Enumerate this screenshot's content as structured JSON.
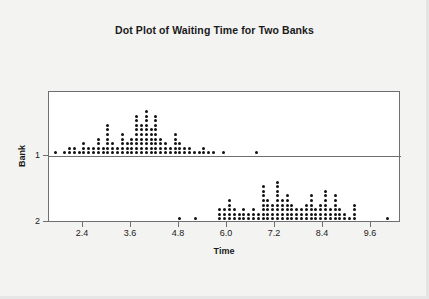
{
  "chart_data": {
    "type": "scatter",
    "plot_style": "dotplot",
    "title": "Dot Plot of Waiting Time for Two Banks",
    "xlabel": "Time",
    "ylabel": "Bank",
    "grid": false,
    "legend": "none",
    "xlim": [
      1.55,
      10.35
    ],
    "x_ticks": [
      2.4,
      3.6,
      4.8,
      6.0,
      7.2,
      8.4,
      9.6
    ],
    "x_tick_labels": [
      "2.4",
      "3.6",
      "4.8",
      "6.0",
      "7.2",
      "8.4",
      "9.6"
    ],
    "y_ticks": [
      1,
      2
    ],
    "y_tick_labels": [
      "1",
      "2"
    ],
    "bin_width": 0.12,
    "panels": [
      {
        "name": "Bank 1",
        "y_value": 1,
        "baseline": "bottom",
        "points": [
          {
            "x": 1.7,
            "count": 1
          },
          {
            "x": 1.94,
            "count": 1
          },
          {
            "x": 2.06,
            "count": 2
          },
          {
            "x": 2.18,
            "count": 2
          },
          {
            "x": 2.3,
            "count": 1
          },
          {
            "x": 2.42,
            "count": 3
          },
          {
            "x": 2.54,
            "count": 2
          },
          {
            "x": 2.66,
            "count": 2
          },
          {
            "x": 2.78,
            "count": 4
          },
          {
            "x": 2.9,
            "count": 2
          },
          {
            "x": 3.02,
            "count": 7
          },
          {
            "x": 3.14,
            "count": 3
          },
          {
            "x": 3.26,
            "count": 2
          },
          {
            "x": 3.38,
            "count": 5
          },
          {
            "x": 3.5,
            "count": 3
          },
          {
            "x": 3.62,
            "count": 4
          },
          {
            "x": 3.74,
            "count": 9
          },
          {
            "x": 3.86,
            "count": 7
          },
          {
            "x": 3.98,
            "count": 10
          },
          {
            "x": 4.1,
            "count": 6
          },
          {
            "x": 4.22,
            "count": 9
          },
          {
            "x": 4.34,
            "count": 4
          },
          {
            "x": 4.46,
            "count": 3
          },
          {
            "x": 4.58,
            "count": 2
          },
          {
            "x": 4.7,
            "count": 5
          },
          {
            "x": 4.82,
            "count": 3
          },
          {
            "x": 4.94,
            "count": 2
          },
          {
            "x": 5.06,
            "count": 2
          },
          {
            "x": 5.18,
            "count": 1
          },
          {
            "x": 5.3,
            "count": 1
          },
          {
            "x": 5.42,
            "count": 2
          },
          {
            "x": 5.54,
            "count": 1
          },
          {
            "x": 5.66,
            "count": 1
          },
          {
            "x": 5.9,
            "count": 1
          },
          {
            "x": 6.74,
            "count": 1
          }
        ]
      },
      {
        "name": "Bank 2",
        "y_value": 2,
        "baseline": "bottom",
        "points": [
          {
            "x": 4.8,
            "count": 1
          },
          {
            "x": 5.22,
            "count": 1
          },
          {
            "x": 5.82,
            "count": 3
          },
          {
            "x": 5.94,
            "count": 3
          },
          {
            "x": 6.06,
            "count": 5
          },
          {
            "x": 6.18,
            "count": 3
          },
          {
            "x": 6.3,
            "count": 2
          },
          {
            "x": 6.42,
            "count": 3
          },
          {
            "x": 6.54,
            "count": 2
          },
          {
            "x": 6.66,
            "count": 3
          },
          {
            "x": 6.78,
            "count": 2
          },
          {
            "x": 6.9,
            "count": 8
          },
          {
            "x": 7.02,
            "count": 5
          },
          {
            "x": 7.14,
            "count": 4
          },
          {
            "x": 7.26,
            "count": 9
          },
          {
            "x": 7.38,
            "count": 5
          },
          {
            "x": 7.5,
            "count": 6
          },
          {
            "x": 7.62,
            "count": 4
          },
          {
            "x": 7.74,
            "count": 3
          },
          {
            "x": 7.86,
            "count": 3
          },
          {
            "x": 7.98,
            "count": 4
          },
          {
            "x": 8.1,
            "count": 6
          },
          {
            "x": 8.22,
            "count": 3
          },
          {
            "x": 8.34,
            "count": 4
          },
          {
            "x": 8.46,
            "count": 7
          },
          {
            "x": 8.58,
            "count": 3
          },
          {
            "x": 8.7,
            "count": 6
          },
          {
            "x": 8.82,
            "count": 3
          },
          {
            "x": 8.94,
            "count": 2
          },
          {
            "x": 9.06,
            "count": 1
          },
          {
            "x": 9.18,
            "count": 4
          },
          {
            "x": 10.02,
            "count": 1
          }
        ]
      }
    ]
  }
}
